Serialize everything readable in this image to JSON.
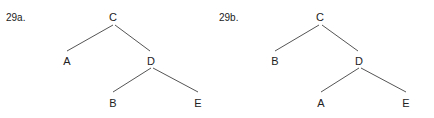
{
  "figures": [
    {
      "label": "29a.",
      "nodes": {
        "root": "C",
        "left": "A",
        "right": "D",
        "right_left": "B",
        "right_right": "E"
      }
    },
    {
      "label": "29b.",
      "nodes": {
        "root": "C",
        "left": "B",
        "right": "D",
        "right_left": "A",
        "right_right": "E"
      }
    }
  ],
  "colors": {
    "line": "#555555",
    "text": "#222222"
  }
}
